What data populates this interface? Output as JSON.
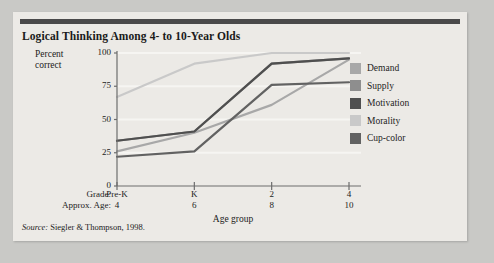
{
  "figure": {
    "title": "Logical Thinking Among 4- to 10-Year Olds",
    "source_label": "Source:",
    "source_text": " Siegler & Thompson, 1998."
  },
  "axes": {
    "ylabel_line1": "Percent",
    "ylabel_line2": "correct",
    "xlabel": "Age group",
    "grade_caption": "Grade:",
    "age_caption": "Approx. Age:"
  },
  "colors": {
    "card_background": "#eceae6",
    "page_background": "#c9c9c6",
    "top_rule": "#4a4a4a",
    "axis": "#6d6d6d",
    "gridline": "#f6f5f2",
    "text": "#1d1d1d",
    "demand": "#a8a8a8",
    "supply": "#8e8e8e",
    "motivation": "#4f4f4f",
    "morality": "#c9c9c9",
    "cup_color": "#626262"
  },
  "chart_data": {
    "type": "line",
    "title": "Logical Thinking Among 4- to 10-Year Olds",
    "xlabel": "Age group",
    "ylabel": "Percent correct",
    "categories": [
      "Pre-K",
      "K",
      "2",
      "4"
    ],
    "tick_labels_grade": [
      "Pre-K",
      "K",
      "2",
      "4"
    ],
    "tick_labels_age": [
      "4",
      "6",
      "8",
      "10"
    ],
    "ylim": [
      0,
      100
    ],
    "yticks": [
      0,
      25,
      50,
      75,
      100
    ],
    "ytick_labels": [
      "0",
      "25",
      "50",
      "75",
      "100"
    ],
    "grid": true,
    "legend_position": "right",
    "series": [
      {
        "name": "Demand",
        "color": "#a8a8a8",
        "values": [
          26,
          40,
          61,
          95
        ]
      },
      {
        "name": "Supply",
        "color": "#8e8e8e",
        "values": [
          34,
          41,
          92,
          96
        ]
      },
      {
        "name": "Motivation",
        "color": "#4f4f4f",
        "values": [
          34,
          41,
          92,
          96
        ]
      },
      {
        "name": "Morality",
        "color": "#c9c9c9",
        "values": [
          67,
          92,
          100,
          100
        ]
      },
      {
        "name": "Cup-color",
        "color": "#626262",
        "values": [
          22,
          26,
          76,
          78
        ]
      }
    ]
  },
  "legend": {
    "items": [
      {
        "label": "Demand",
        "color": "#a8a8a8"
      },
      {
        "label": "Supply",
        "color": "#8e8e8e"
      },
      {
        "label": "Motivation",
        "color": "#4f4f4f"
      },
      {
        "label": "Morality",
        "color": "#c9c9c9"
      },
      {
        "label": "Cup-color",
        "color": "#626262"
      }
    ]
  }
}
